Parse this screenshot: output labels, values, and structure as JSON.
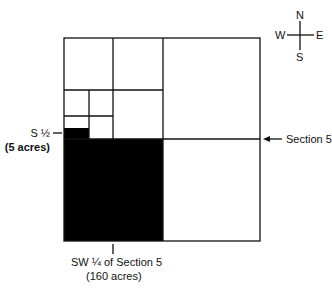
{
  "compass": {
    "n": "N",
    "s": "S",
    "e": "E",
    "w": "W"
  },
  "labels": {
    "s_half": "S ½",
    "s_half_acres": "(5 acres)",
    "section": "Section 5",
    "sw_quarter": "SW ¼ of Section 5",
    "sw_quarter_acres": "(160 acres)"
  },
  "colors": {
    "line": "#111111",
    "fill": "#000000",
    "background": "#ffffff"
  }
}
